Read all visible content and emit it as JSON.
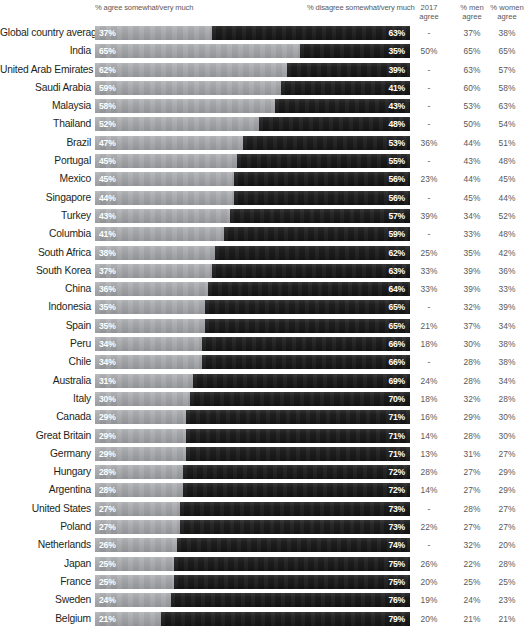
{
  "header": {
    "agree_label": "% agree somewhat/very much",
    "disagree_label": "% disagree somewhat/very much",
    "col_2017": "2017\nagree",
    "col_men": "% men\nagree",
    "col_women": "% women\nagree"
  },
  "colors": {
    "agree_bar": "#a7a9ac",
    "disagree_bar": "#1b1b1b",
    "value_text": "#ffffff",
    "country_text": "#231f20",
    "column_text": "#58595b",
    "background": "#ffffff"
  },
  "chart_data": {
    "type": "bar",
    "subtype": "diverging-stacked-bar",
    "title": "",
    "xlabel": "",
    "ylabel": "",
    "xlim": [
      0,
      100
    ],
    "grid": false,
    "legend_position": "top",
    "categories": [
      "Global country average",
      "India",
      "United Arab Emirates",
      "Saudi Arabia",
      "Malaysia",
      "Thailand",
      "Brazil",
      "Portugal",
      "Mexico",
      "Singapore",
      "Turkey",
      "Columbia",
      "South Africa",
      "South Korea",
      "China",
      "Indonesia",
      "Spain",
      "Peru",
      "Chile",
      "Australia",
      "Italy",
      "Canada",
      "Great Britain",
      "Germany",
      "Hungary",
      "Argentina",
      "United States",
      "Poland",
      "Netherlands",
      "Japan",
      "France",
      "Sweden",
      "Belgium"
    ],
    "series": [
      {
        "name": "% agree somewhat/very much",
        "values": [
          37,
          65,
          62,
          59,
          58,
          52,
          47,
          45,
          45,
          44,
          43,
          41,
          38,
          37,
          36,
          35,
          35,
          34,
          34,
          31,
          30,
          29,
          29,
          29,
          28,
          28,
          27,
          27,
          26,
          25,
          25,
          24,
          21
        ]
      },
      {
        "name": "% disagree somewhat/very much",
        "values": [
          63,
          35,
          39,
          41,
          43,
          48,
          53,
          55,
          56,
          56,
          57,
          59,
          62,
          63,
          64,
          65,
          65,
          66,
          66,
          69,
          70,
          71,
          71,
          71,
          72,
          72,
          73,
          73,
          74,
          75,
          75,
          76,
          79
        ]
      },
      {
        "name": "2017 agree",
        "values": [
          "-",
          "50%",
          "-",
          "-",
          "-",
          "-",
          "36%",
          "-",
          "23%",
          "-",
          "39%",
          "-",
          "25%",
          "33%",
          "33%",
          "-",
          "21%",
          "18%",
          "-",
          "24%",
          "18%",
          "16%",
          "14%",
          "13%",
          "28%",
          "14%",
          "-",
          "22%",
          "-",
          "26%",
          "20%",
          "19%",
          "20%"
        ]
      },
      {
        "name": "% men agree",
        "values": [
          "37%",
          "65%",
          "63%",
          "60%",
          "53%",
          "50%",
          "44%",
          "43%",
          "44%",
          "45%",
          "34%",
          "33%",
          "35%",
          "39%",
          "39%",
          "32%",
          "37%",
          "30%",
          "28%",
          "28%",
          "32%",
          "29%",
          "28%",
          "31%",
          "27%",
          "27%",
          "28%",
          "27%",
          "32%",
          "22%",
          "25%",
          "24%",
          "21%"
        ]
      },
      {
        "name": "% women agree",
        "values": [
          "38%",
          "65%",
          "57%",
          "58%",
          "63%",
          "54%",
          "51%",
          "48%",
          "45%",
          "44%",
          "52%",
          "48%",
          "42%",
          "36%",
          "33%",
          "39%",
          "34%",
          "38%",
          "38%",
          "34%",
          "28%",
          "30%",
          "30%",
          "27%",
          "29%",
          "29%",
          "27%",
          "27%",
          "20%",
          "28%",
          "25%",
          "23%",
          "21%"
        ]
      }
    ],
    "agree_labels": [
      "37%",
      "65%",
      "62%",
      "59%",
      "58%",
      "52%",
      "47%",
      "45%",
      "45%",
      "44%",
      "43%",
      "41%",
      "38%",
      "37%",
      "36%",
      "35%",
      "35%",
      "34%",
      "34%",
      "31%",
      "30%",
      "29%",
      "29%",
      "29%",
      "28%",
      "28%",
      "27%",
      "27%",
      "26%",
      "25%",
      "25%",
      "24%",
      "21%"
    ],
    "disagree_labels": [
      "63%",
      "35%",
      "39%",
      "41%",
      "43%",
      "48%",
      "53%",
      "55%",
      "56%",
      "56%",
      "57%",
      "59%",
      "62%",
      "63%",
      "64%",
      "65%",
      "65%",
      "66%",
      "66%",
      "69%",
      "70%",
      "71%",
      "71%",
      "71%",
      "72%",
      "72%",
      "73%",
      "73%",
      "74%",
      "75%",
      "75%",
      "76%",
      "79%"
    ]
  }
}
